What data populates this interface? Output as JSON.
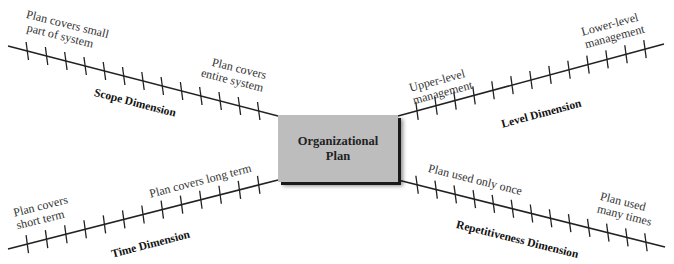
{
  "center": {
    "line1": "Organizational",
    "line2": "Plan",
    "fill": "#bdbdbd"
  },
  "dimensions": [
    {
      "id": "scope",
      "name": "Scope Dimension",
      "start_label": [
        "Plan covers small",
        "part of system"
      ],
      "end_label": [
        "Plan covers",
        "entire system"
      ],
      "from": [
        8,
        46
      ],
      "to": [
        278,
        116
      ],
      "ticks": 13
    },
    {
      "id": "level",
      "name": "Level Dimension",
      "start_label": [
        "Upper-level",
        "management"
      ],
      "end_label": [
        "Lower-level",
        "management"
      ],
      "from": [
        398,
        116
      ],
      "to": [
        664,
        44
      ],
      "ticks": 13
    },
    {
      "id": "time",
      "name": "Time Dimension",
      "start_label": [
        "Plan covers",
        "short term"
      ],
      "end_label": [
        "Plan covers long term"
      ],
      "from": [
        8,
        249
      ],
      "to": [
        278,
        180
      ],
      "ticks": 13
    },
    {
      "id": "repetitiveness",
      "name": "Repetitiveness Dimension",
      "start_label": [
        "Plan used only once"
      ],
      "end_label": [
        "Plan used",
        "many times"
      ],
      "from": [
        398,
        180
      ],
      "to": [
        665,
        247
      ],
      "ticks": 13
    }
  ],
  "labels": {
    "scope_start_1": "Plan covers small",
    "scope_start_2": "part of system",
    "scope_end_1": "Plan covers",
    "scope_end_2": "entire system",
    "scope_name": "Scope Dimension",
    "level_start_1": "Upper-level",
    "level_start_2": "management",
    "level_end_1": "Lower-level",
    "level_end_2": "management",
    "level_name": "Level Dimension",
    "time_start_1": "Plan covers",
    "time_start_2": "short term",
    "time_end_1": "Plan covers long term",
    "time_name": "Time Dimension",
    "rep_start_1": "Plan used only once",
    "rep_end_1": "Plan used",
    "rep_end_2": "many times",
    "rep_name": "Repetitiveness Dimension"
  }
}
